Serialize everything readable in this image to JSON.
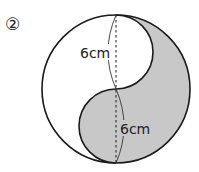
{
  "problem_number": "②",
  "labels": {
    "upper_length": "6cm",
    "lower_length": "6cm"
  },
  "colors": {
    "shade": "#c8c8c8",
    "stroke": "#1a1a1a",
    "background": "#ffffff"
  }
}
